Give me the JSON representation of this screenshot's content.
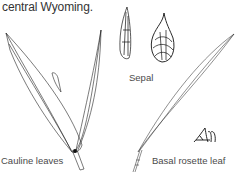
{
  "caption": "central Wyoming.",
  "labels": {
    "sepal": "Sepal",
    "cauline": "Cauline leaves",
    "basal": "Basal rosette leaf"
  },
  "signature": "AM",
  "colors": {
    "ink": "#222222",
    "text": "#4a4a4a",
    "background": "#ffffff"
  }
}
